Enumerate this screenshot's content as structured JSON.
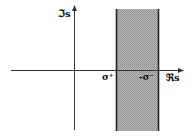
{
  "diagram": {
    "type": "complex-plane-strip",
    "axes": {
      "imaginary_label": "ℑs",
      "real_label": "ℜs"
    },
    "strip": {
      "left_label": "σ⁺",
      "right_label": "-σ⁻",
      "fill_color": "#a9a9a9",
      "edge_color": "#222222"
    },
    "axis_color": "#333333"
  }
}
